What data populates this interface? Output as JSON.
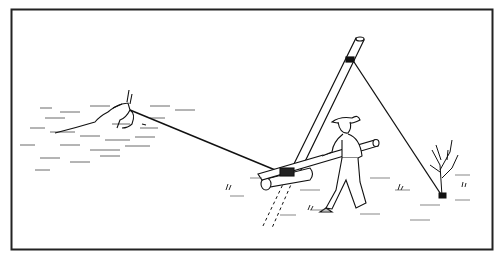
{
  "illustration": {
    "description": "Line drawing: a man uses a long lever pole and gin-pole rigging to pull a mired cow out of mud; a guy line from the pole top is anchored to a bush.",
    "elements": {
      "frame": "black rectangular border",
      "cow": "cow stuck in mud/water, left",
      "rope": "rope from cow to lever at pole base",
      "gin_pole": "tall diagonal pole",
      "guy_line": "line from pole top to bush anchor",
      "man": "man in cowboy hat pushing lever pole",
      "lever": "long lever pole with log fulcrum",
      "bush": "bare shrub anchor, right",
      "stake": "dashed underground stake line"
    },
    "colors": {
      "ink": "#111111",
      "paper": "#ffffff"
    }
  }
}
